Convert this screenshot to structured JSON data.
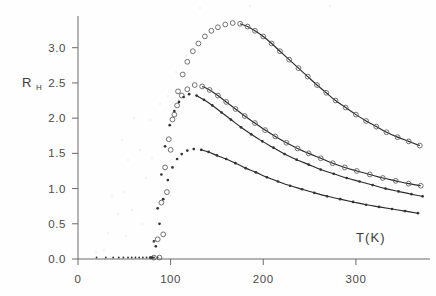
{
  "figure": {
    "name": "hall-coefficient-vs-temperature",
    "background_color": "#fefefe",
    "ink_color": "#2b2b2b"
  },
  "axes": {
    "y_label_main": "R",
    "y_label_sub": "H",
    "x_label": "T(K)",
    "x_ticks": [
      "0",
      "100",
      "200",
      "300"
    ],
    "y_ticks": [
      "0.0",
      "0.5",
      "1.0",
      "1.5",
      "2.0",
      "2.5",
      "3.0"
    ]
  },
  "chart_data": {
    "type": "scatter",
    "title": "",
    "xlabel": "T(K)",
    "ylabel": "R_H",
    "xlim": [
      0,
      380
    ],
    "ylim": [
      0.0,
      3.45
    ],
    "x_ticks": [
      0,
      100,
      200,
      300
    ],
    "y_ticks": [
      0.0,
      0.5,
      1.0,
      1.5,
      2.0,
      2.5,
      3.0
    ],
    "grid": false,
    "legend": "none",
    "series": [
      {
        "name": "sample-1-top",
        "marker": "open-circle",
        "peak": {
          "x": 167,
          "y": 3.35
        },
        "points": [
          {
            "x": 88,
            "y": 0.02
          },
          {
            "x": 92,
            "y": 0.35
          },
          {
            "x": 96,
            "y": 0.95
          },
          {
            "x": 100,
            "y": 1.55
          },
          {
            "x": 104,
            "y": 2.05
          },
          {
            "x": 108,
            "y": 2.38
          },
          {
            "x": 113,
            "y": 2.62
          },
          {
            "x": 118,
            "y": 2.8
          },
          {
            "x": 124,
            "y": 2.95
          },
          {
            "x": 130,
            "y": 3.06
          },
          {
            "x": 137,
            "y": 3.16
          },
          {
            "x": 144,
            "y": 3.24
          },
          {
            "x": 151,
            "y": 3.29
          },
          {
            "x": 159,
            "y": 3.33
          },
          {
            "x": 167,
            "y": 3.35
          },
          {
            "x": 175,
            "y": 3.34
          },
          {
            "x": 183,
            "y": 3.3
          },
          {
            "x": 191,
            "y": 3.24
          },
          {
            "x": 200,
            "y": 3.16
          },
          {
            "x": 209,
            "y": 3.06
          },
          {
            "x": 218,
            "y": 2.95
          },
          {
            "x": 228,
            "y": 2.83
          },
          {
            "x": 238,
            "y": 2.71
          },
          {
            "x": 248,
            "y": 2.59
          },
          {
            "x": 258,
            "y": 2.47
          },
          {
            "x": 268,
            "y": 2.36
          },
          {
            "x": 278,
            "y": 2.25
          },
          {
            "x": 289,
            "y": 2.15
          },
          {
            "x": 300,
            "y": 2.05
          },
          {
            "x": 311,
            "y": 1.96
          },
          {
            "x": 322,
            "y": 1.88
          },
          {
            "x": 333,
            "y": 1.8
          },
          {
            "x": 345,
            "y": 1.73
          },
          {
            "x": 357,
            "y": 1.67
          },
          {
            "x": 369,
            "y": 1.61
          }
        ]
      },
      {
        "name": "sample-2",
        "marker": "open-circle",
        "peak": {
          "x": 126,
          "y": 2.47
        },
        "points": [
          {
            "x": 82,
            "y": 0.02
          },
          {
            "x": 86,
            "y": 0.28
          },
          {
            "x": 90,
            "y": 0.8
          },
          {
            "x": 94,
            "y": 1.3
          },
          {
            "x": 98,
            "y": 1.7
          },
          {
            "x": 102,
            "y": 1.98
          },
          {
            "x": 107,
            "y": 2.18
          },
          {
            "x": 112,
            "y": 2.32
          },
          {
            "x": 118,
            "y": 2.41
          },
          {
            "x": 126,
            "y": 2.47
          },
          {
            "x": 134,
            "y": 2.45
          },
          {
            "x": 142,
            "y": 2.4
          },
          {
            "x": 151,
            "y": 2.32
          },
          {
            "x": 160,
            "y": 2.23
          },
          {
            "x": 170,
            "y": 2.13
          },
          {
            "x": 180,
            "y": 2.03
          },
          {
            "x": 191,
            "y": 1.93
          },
          {
            "x": 202,
            "y": 1.83
          },
          {
            "x": 213,
            "y": 1.74
          },
          {
            "x": 225,
            "y": 1.65
          },
          {
            "x": 237,
            "y": 1.57
          },
          {
            "x": 249,
            "y": 1.5
          },
          {
            "x": 262,
            "y": 1.43
          },
          {
            "x": 275,
            "y": 1.36
          },
          {
            "x": 288,
            "y": 1.3
          },
          {
            "x": 301,
            "y": 1.25
          },
          {
            "x": 315,
            "y": 1.2
          },
          {
            "x": 329,
            "y": 1.15
          },
          {
            "x": 343,
            "y": 1.11
          },
          {
            "x": 357,
            "y": 1.07
          },
          {
            "x": 370,
            "y": 1.04
          }
        ]
      },
      {
        "name": "sample-3",
        "marker": "filled-dot",
        "peak": {
          "x": 120,
          "y": 2.34
        },
        "points": [
          {
            "x": 78,
            "y": 0.02
          },
          {
            "x": 82,
            "y": 0.25
          },
          {
            "x": 86,
            "y": 0.72
          },
          {
            "x": 90,
            "y": 1.2
          },
          {
            "x": 94,
            "y": 1.6
          },
          {
            "x": 99,
            "y": 1.9
          },
          {
            "x": 104,
            "y": 2.1
          },
          {
            "x": 109,
            "y": 2.23
          },
          {
            "x": 114,
            "y": 2.3
          },
          {
            "x": 120,
            "y": 2.34
          },
          {
            "x": 128,
            "y": 2.32
          },
          {
            "x": 136,
            "y": 2.26
          },
          {
            "x": 145,
            "y": 2.18
          },
          {
            "x": 155,
            "y": 2.08
          },
          {
            "x": 165,
            "y": 1.98
          },
          {
            "x": 176,
            "y": 1.87
          },
          {
            "x": 187,
            "y": 1.77
          },
          {
            "x": 199,
            "y": 1.67
          },
          {
            "x": 211,
            "y": 1.58
          },
          {
            "x": 223,
            "y": 1.49
          },
          {
            "x": 236,
            "y": 1.41
          },
          {
            "x": 249,
            "y": 1.34
          },
          {
            "x": 262,
            "y": 1.27
          },
          {
            "x": 276,
            "y": 1.21
          },
          {
            "x": 290,
            "y": 1.15
          },
          {
            "x": 304,
            "y": 1.1
          },
          {
            "x": 318,
            "y": 1.05
          },
          {
            "x": 332,
            "y": 1.0
          },
          {
            "x": 346,
            "y": 0.96
          },
          {
            "x": 360,
            "y": 0.92
          },
          {
            "x": 372,
            "y": 0.89
          }
        ]
      },
      {
        "name": "sample-4-bottom",
        "marker": "filled-dot",
        "peak": {
          "x": 125,
          "y": 1.56
        },
        "points": [
          {
            "x": 80,
            "y": 0.02
          },
          {
            "x": 84,
            "y": 0.18
          },
          {
            "x": 88,
            "y": 0.5
          },
          {
            "x": 92,
            "y": 0.85
          },
          {
            "x": 97,
            "y": 1.12
          },
          {
            "x": 102,
            "y": 1.3
          },
          {
            "x": 107,
            "y": 1.42
          },
          {
            "x": 112,
            "y": 1.49
          },
          {
            "x": 118,
            "y": 1.54
          },
          {
            "x": 125,
            "y": 1.56
          },
          {
            "x": 133,
            "y": 1.55
          },
          {
            "x": 141,
            "y": 1.52
          },
          {
            "x": 150,
            "y": 1.47
          },
          {
            "x": 160,
            "y": 1.42
          },
          {
            "x": 170,
            "y": 1.36
          },
          {
            "x": 181,
            "y": 1.29
          },
          {
            "x": 192,
            "y": 1.23
          },
          {
            "x": 204,
            "y": 1.16
          },
          {
            "x": 216,
            "y": 1.1
          },
          {
            "x": 229,
            "y": 1.04
          },
          {
            "x": 242,
            "y": 0.99
          },
          {
            "x": 255,
            "y": 0.94
          },
          {
            "x": 269,
            "y": 0.89
          },
          {
            "x": 283,
            "y": 0.85
          },
          {
            "x": 297,
            "y": 0.81
          },
          {
            "x": 311,
            "y": 0.77
          },
          {
            "x": 325,
            "y": 0.74
          },
          {
            "x": 339,
            "y": 0.71
          },
          {
            "x": 353,
            "y": 0.68
          },
          {
            "x": 367,
            "y": 0.65
          }
        ]
      }
    ],
    "zero_baseline_points": [
      {
        "x": 20,
        "y": 0.0
      },
      {
        "x": 30,
        "y": 0.0
      },
      {
        "x": 38,
        "y": 0.0
      },
      {
        "x": 44,
        "y": 0.0
      },
      {
        "x": 49,
        "y": 0.0
      },
      {
        "x": 54,
        "y": 0.0
      },
      {
        "x": 58,
        "y": 0.0
      },
      {
        "x": 62,
        "y": 0.0
      },
      {
        "x": 66,
        "y": 0.0
      },
      {
        "x": 70,
        "y": 0.0
      },
      {
        "x": 74,
        "y": 0.0
      },
      {
        "x": 78,
        "y": 0.0
      },
      {
        "x": 82,
        "y": 0.0
      },
      {
        "x": 86,
        "y": 0.0
      }
    ]
  }
}
